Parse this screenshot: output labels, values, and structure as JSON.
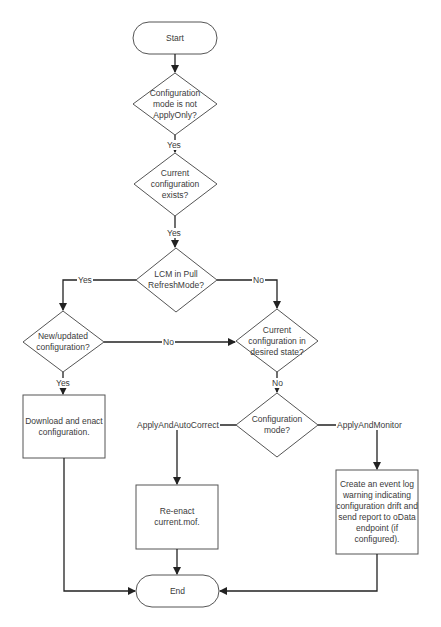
{
  "diagram": {
    "type": "flowchart",
    "nodes": {
      "start": {
        "label": "Start",
        "shape": "terminator"
      },
      "mode_not_apply_only": {
        "label": "Configuration mode is not ApplyOnly?",
        "shape": "decision"
      },
      "current_config_exists": {
        "label": "Current configuration exists?",
        "shape": "decision"
      },
      "lcm_pull_refresh": {
        "label": "LCM in Pull RefreshMode?",
        "shape": "decision"
      },
      "new_updated_config": {
        "label": "New/updated configuration?",
        "shape": "decision"
      },
      "desired_state": {
        "label": "Current configuration in desired state?",
        "shape": "decision"
      },
      "config_mode": {
        "label": "Configuration mode?",
        "shape": "decision"
      },
      "download_enact": {
        "label": "Download and enact configuration.",
        "shape": "process"
      },
      "reenact": {
        "label": "Re-enact current.mof.",
        "shape": "process"
      },
      "event_log": {
        "label": "Create an event log warning indicating configuration drift and send report to oData endpoint (if configured).",
        "shape": "process"
      },
      "end": {
        "label": "End",
        "shape": "terminator"
      }
    },
    "edges": [
      {
        "from": "start",
        "to": "mode_not_apply_only",
        "label": ""
      },
      {
        "from": "mode_not_apply_only",
        "to": "current_config_exists",
        "label": "Yes"
      },
      {
        "from": "current_config_exists",
        "to": "lcm_pull_refresh",
        "label": "Yes"
      },
      {
        "from": "lcm_pull_refresh",
        "to": "new_updated_config",
        "label": "Yes"
      },
      {
        "from": "lcm_pull_refresh",
        "to": "desired_state",
        "label": "No"
      },
      {
        "from": "new_updated_config",
        "to": "download_enact",
        "label": "Yes"
      },
      {
        "from": "new_updated_config",
        "to": "desired_state",
        "label": "No"
      },
      {
        "from": "desired_state",
        "to": "config_mode",
        "label": "No"
      },
      {
        "from": "config_mode",
        "to": "reenact",
        "label": "ApplyAndAutoCorrect"
      },
      {
        "from": "config_mode",
        "to": "event_log",
        "label": "ApplyAndMonitor"
      },
      {
        "from": "download_enact",
        "to": "end",
        "label": ""
      },
      {
        "from": "reenact",
        "to": "end",
        "label": ""
      },
      {
        "from": "event_log",
        "to": "end",
        "label": ""
      }
    ]
  },
  "labels": {
    "start": "Start",
    "d1_line1": "Configuration",
    "d1_line2": "mode is not",
    "d1_line3": "ApplyOnly?",
    "d2_line1": "Current",
    "d2_line2": "configuration",
    "d2_line3": "exists?",
    "d3_line1": "LCM in Pull",
    "d3_line2": "RefreshMode?",
    "d4_line1": "New/updated",
    "d4_line2": "configuration?",
    "d5_line1": "Current",
    "d5_line2": "configuration in",
    "d5_line3": "desired state?",
    "d6_line1": "Configuration",
    "d6_line2": "mode?",
    "box1_line1": "Download and enact",
    "box1_line2": "configuration.",
    "box2_line1": "Re-enact",
    "box2_line2": "current.mof.",
    "box3_line1": "Create an event log",
    "box3_line2": "warning indicating",
    "box3_line3": "configuration drift and",
    "box3_line4": "send report to oData",
    "box3_line5": "endpoint (if",
    "box3_line6": "configured).",
    "end": "End",
    "yes": "Yes",
    "no": "No",
    "apply_auto_correct": "ApplyAndAutoCorrect",
    "apply_monitor": "ApplyAndMonitor"
  }
}
